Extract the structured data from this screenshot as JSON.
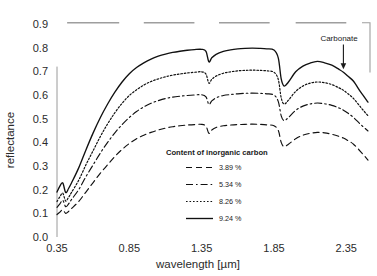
{
  "chart_data": {
    "type": "line",
    "title": "",
    "xlabel": "wavelength [µm]",
    "ylabel": "reflectance",
    "xlim": [
      0.35,
      2.5
    ],
    "ylim": [
      0.0,
      0.9
    ],
    "xticks": [
      0.35,
      0.85,
      1.35,
      1.85,
      2.35
    ],
    "xticklabels": [
      "0.35",
      "0.85",
      "1.35",
      "1.85",
      "2.35"
    ],
    "yticks": [
      0.0,
      0.1,
      0.2,
      0.3,
      0.4,
      0.5,
      0.6,
      0.7,
      0.8,
      0.9
    ],
    "yticklabels": [
      "0.0",
      "0.1",
      "0.2",
      "0.3",
      "0.4",
      "0.5",
      "0.6",
      "0.7",
      "0.8",
      "0.9"
    ],
    "grid": false,
    "legend_position": "center",
    "legend_title": "Content of inorganic carbon",
    "annotations": [
      {
        "text": "Carbonate",
        "x": 2.3,
        "y": 0.83,
        "arrow_to_x": 2.33,
        "arrow_to_y": 0.705
      }
    ],
    "series": [
      {
        "name": "3.89 %",
        "label": "3.89 %",
        "style": "dashed",
        "color": "#111111",
        "x": [
          0.35,
          0.37,
          0.39,
          0.41,
          0.43,
          0.45,
          0.5,
          0.55,
          0.6,
          0.65,
          0.7,
          0.75,
          0.8,
          0.85,
          0.9,
          0.95,
          1.0,
          1.05,
          1.1,
          1.15,
          1.2,
          1.25,
          1.3,
          1.35,
          1.38,
          1.4,
          1.42,
          1.45,
          1.5,
          1.55,
          1.6,
          1.65,
          1.7,
          1.75,
          1.8,
          1.85,
          1.88,
          1.9,
          1.92,
          1.95,
          2.0,
          2.05,
          2.1,
          2.15,
          2.2,
          2.25,
          2.3,
          2.33,
          2.36,
          2.4,
          2.45,
          2.5
        ],
        "y": [
          0.095,
          0.105,
          0.115,
          0.1,
          0.108,
          0.12,
          0.15,
          0.19,
          0.23,
          0.27,
          0.305,
          0.34,
          0.37,
          0.395,
          0.415,
          0.43,
          0.442,
          0.452,
          0.46,
          0.466,
          0.47,
          0.473,
          0.475,
          0.476,
          0.468,
          0.438,
          0.452,
          0.463,
          0.47,
          0.473,
          0.475,
          0.476,
          0.477,
          0.476,
          0.474,
          0.47,
          0.45,
          0.4,
          0.382,
          0.392,
          0.415,
          0.43,
          0.438,
          0.442,
          0.44,
          0.434,
          0.425,
          0.418,
          0.408,
          0.392,
          0.36,
          0.325
        ]
      },
      {
        "name": "5.34 %",
        "label": "5.34 %",
        "style": "dashdot",
        "color": "#111111",
        "x": [
          0.35,
          0.37,
          0.39,
          0.41,
          0.43,
          0.45,
          0.5,
          0.55,
          0.6,
          0.65,
          0.7,
          0.75,
          0.8,
          0.85,
          0.9,
          0.95,
          1.0,
          1.05,
          1.1,
          1.15,
          1.2,
          1.25,
          1.3,
          1.35,
          1.38,
          1.4,
          1.42,
          1.45,
          1.5,
          1.55,
          1.6,
          1.65,
          1.7,
          1.75,
          1.8,
          1.85,
          1.88,
          1.9,
          1.92,
          1.95,
          2.0,
          2.05,
          2.1,
          2.15,
          2.2,
          2.25,
          2.3,
          2.33,
          2.36,
          2.4,
          2.45,
          2.5
        ],
        "y": [
          0.125,
          0.14,
          0.155,
          0.128,
          0.14,
          0.158,
          0.2,
          0.255,
          0.305,
          0.355,
          0.4,
          0.44,
          0.475,
          0.505,
          0.53,
          0.55,
          0.565,
          0.576,
          0.585,
          0.591,
          0.595,
          0.598,
          0.6,
          0.601,
          0.592,
          0.56,
          0.575,
          0.588,
          0.598,
          0.602,
          0.605,
          0.607,
          0.608,
          0.607,
          0.605,
          0.6,
          0.572,
          0.512,
          0.492,
          0.505,
          0.535,
          0.553,
          0.562,
          0.566,
          0.563,
          0.556,
          0.545,
          0.536,
          0.524,
          0.505,
          0.475,
          0.448
        ]
      },
      {
        "name": "8.26 %",
        "label": "8.26 %",
        "style": "dotted",
        "color": "#111111",
        "x": [
          0.35,
          0.37,
          0.39,
          0.41,
          0.43,
          0.45,
          0.5,
          0.55,
          0.6,
          0.65,
          0.7,
          0.75,
          0.8,
          0.85,
          0.9,
          0.95,
          1.0,
          1.05,
          1.1,
          1.15,
          1.2,
          1.25,
          1.3,
          1.35,
          1.38,
          1.4,
          1.42,
          1.45,
          1.5,
          1.55,
          1.6,
          1.65,
          1.7,
          1.75,
          1.8,
          1.85,
          1.88,
          1.9,
          1.92,
          1.95,
          2.0,
          2.05,
          2.1,
          2.15,
          2.2,
          2.25,
          2.3,
          2.33,
          2.36,
          2.4,
          2.45,
          2.5
        ],
        "y": [
          0.15,
          0.17,
          0.185,
          0.152,
          0.168,
          0.188,
          0.24,
          0.305,
          0.365,
          0.425,
          0.478,
          0.525,
          0.565,
          0.598,
          0.622,
          0.642,
          0.657,
          0.668,
          0.677,
          0.684,
          0.689,
          0.693,
          0.696,
          0.698,
          0.688,
          0.65,
          0.666,
          0.68,
          0.692,
          0.698,
          0.702,
          0.704,
          0.705,
          0.704,
          0.702,
          0.696,
          0.665,
          0.588,
          0.562,
          0.578,
          0.615,
          0.638,
          0.65,
          0.655,
          0.652,
          0.644,
          0.63,
          0.62,
          0.606,
          0.585,
          0.548,
          0.512
        ]
      },
      {
        "name": "9.24 %",
        "label": "9.24 %",
        "style": "solid",
        "color": "#111111",
        "x": [
          0.35,
          0.37,
          0.39,
          0.41,
          0.43,
          0.45,
          0.5,
          0.55,
          0.6,
          0.65,
          0.7,
          0.75,
          0.8,
          0.85,
          0.9,
          0.95,
          1.0,
          1.05,
          1.1,
          1.15,
          1.2,
          1.25,
          1.3,
          1.35,
          1.38,
          1.4,
          1.42,
          1.45,
          1.5,
          1.55,
          1.6,
          1.65,
          1.7,
          1.75,
          1.8,
          1.85,
          1.88,
          1.9,
          1.92,
          1.95,
          2.0,
          2.05,
          2.1,
          2.15,
          2.2,
          2.25,
          2.3,
          2.33,
          2.36,
          2.4,
          2.45,
          2.5
        ],
        "y": [
          0.19,
          0.215,
          0.228,
          0.188,
          0.205,
          0.228,
          0.292,
          0.368,
          0.44,
          0.505,
          0.562,
          0.612,
          0.655,
          0.69,
          0.716,
          0.736,
          0.752,
          0.764,
          0.773,
          0.78,
          0.785,
          0.789,
          0.792,
          0.793,
          0.784,
          0.74,
          0.757,
          0.772,
          0.784,
          0.791,
          0.795,
          0.797,
          0.798,
          0.797,
          0.795,
          0.79,
          0.756,
          0.668,
          0.638,
          0.655,
          0.698,
          0.722,
          0.735,
          0.742,
          0.736,
          0.726,
          0.708,
          0.696,
          0.68,
          0.658,
          0.612,
          0.57
        ]
      }
    ],
    "region_bars": [
      {
        "x_start": 0.42,
        "x_end": 0.78,
        "y": 0.905
      },
      {
        "x_start": 0.95,
        "x_end": 1.3,
        "y": 0.905
      },
      {
        "x_start": 1.47,
        "x_end": 1.82,
        "y": 0.905
      },
      {
        "x_start": 2.0,
        "x_end": 2.35,
        "y": 0.905
      }
    ]
  }
}
